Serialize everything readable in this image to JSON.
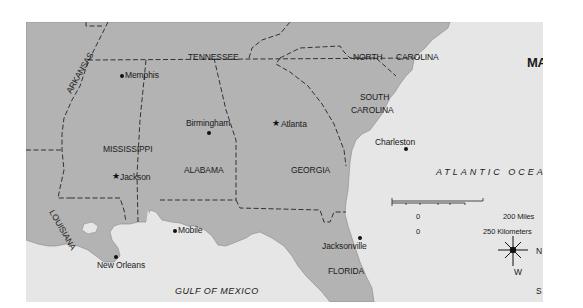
{
  "map": {
    "title": "MAP B",
    "colors": {
      "land": "#b3b3b3",
      "water": "#e6e6e6",
      "border": "#333333",
      "text": "#1a1a1a"
    },
    "states": [
      {
        "name": "TENNESSEE"
      },
      {
        "name": "NORTH CAROLINA",
        "line1": "NORTH",
        "line2": "CAROLINA"
      },
      {
        "name": "ARKANSAS"
      },
      {
        "name": "MISSISSIPPI"
      },
      {
        "name": "ALABAMA"
      },
      {
        "name": "GEORGIA"
      },
      {
        "name": "SOUTH CAROLINA",
        "line1": "SOUTH",
        "line2": "CAROLINA"
      },
      {
        "name": "LOUISIANA"
      },
      {
        "name": "FLORIDA"
      }
    ],
    "cities": [
      {
        "name": "Memphis",
        "marker": "dot"
      },
      {
        "name": "Birmingham",
        "marker": "dot"
      },
      {
        "name": "Atlanta",
        "marker": "star"
      },
      {
        "name": "Charleston",
        "marker": "dot"
      },
      {
        "name": "Jackson",
        "marker": "star"
      },
      {
        "name": "Mobile",
        "marker": "dot"
      },
      {
        "name": "Jacksonville",
        "marker": "dot"
      },
      {
        "name": "New Orleans",
        "marker": "dot"
      }
    ],
    "water_bodies": [
      {
        "name": "ATLANTIC OCEAN"
      },
      {
        "name": "GULF OF MEXICO"
      }
    ],
    "scale": {
      "miles_start": "0",
      "miles_end": "200 Miles",
      "km_start": "0",
      "km_end": "250 Kilometers"
    },
    "compass": {
      "n": "N",
      "s": "S",
      "e": "E",
      "w": "W"
    }
  }
}
